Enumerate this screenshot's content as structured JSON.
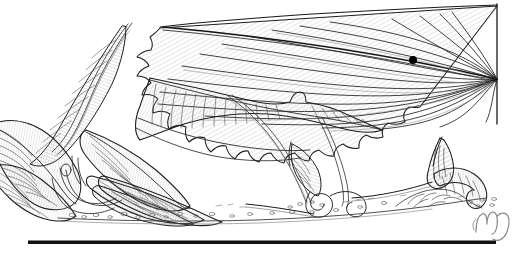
{
  "plate": {
    "title": "Pen-and-ink botanical illustration of serrated leaves and emerging seedlings",
    "medium": "ink-line-drawing",
    "background_color": "#ffffff",
    "ink_color": "#1a1a1a",
    "hatch_color": "#5a5a5a",
    "caption": ""
  },
  "marks": {
    "specimen_dot": {
      "label": "specimen-dot",
      "color": "#000000",
      "x": 413,
      "y": 60,
      "diameter": 8
    },
    "signature": {
      "label": "MJ",
      "color": "#8a8a8a",
      "x": 478,
      "y": 212
    },
    "baseline_rule": {
      "label": "plate-rule",
      "color": "#111111",
      "x": 28,
      "y": 241,
      "width": 468,
      "height": 3
    }
  },
  "elements": [
    {
      "name": "upper-serrated-leaf",
      "description": "Large fan-shaped leaf with toothed margin, top right, cut by frame edge"
    },
    {
      "name": "frame-edge-right",
      "description": "Vertical plate border at right truncating the upper leaf"
    },
    {
      "name": "arching-stem-upper",
      "description": "Slender arching stem rising from left toward top centre"
    },
    {
      "name": "long-hatched-leaf-mid",
      "description": "Long tapered hatched leaf spanning mid-left to centre"
    },
    {
      "name": "leaf-cluster-left",
      "description": "Dense cluster of ribbed leaves at left margin"
    },
    {
      "name": "seedling-left",
      "description": "Curled emerging seedling with hooked tip, centre-left on soil"
    },
    {
      "name": "seedling-right",
      "description": "Curled emerging seedling with coiled crosier, right of centre on soil"
    },
    {
      "name": "thin-stem-arc",
      "description": "Thin double-line stem arcing between the two seedlings"
    },
    {
      "name": "soil-line",
      "description": "Stippled ground line with scattered pebbles across the lower third"
    }
  ]
}
